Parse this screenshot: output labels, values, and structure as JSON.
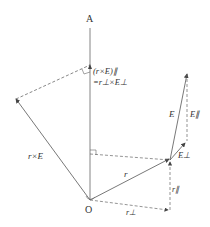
{
  "diagram": {
    "labels": {
      "axis_top": "A",
      "origin": "O",
      "cross_parallel_line1": "(r×E)∥",
      "cross_parallel_line2": "=r⊥×E⊥",
      "cross_product": "r×E",
      "position": "r",
      "field": "E",
      "field_parallel": "E∥",
      "field_perp": "E⊥",
      "r_parallel": "r∥",
      "r_perp": "r⊥"
    },
    "colors": {
      "line": "#555555",
      "text": "#333333"
    }
  }
}
